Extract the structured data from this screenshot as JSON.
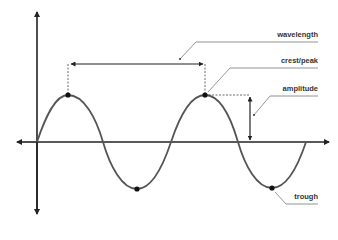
{
  "diagram": {
    "labels": {
      "wavelength": "wavelength",
      "crest": "crest/peak",
      "amplitude": "amplitude",
      "trough": "trough"
    },
    "colors": {
      "axis": "#222222",
      "wave": "#555555",
      "leader": "#666666",
      "dashed": "#444444",
      "point": "#111111",
      "text": "#333333"
    },
    "axes": {
      "origin": [
        37,
        142
      ],
      "x_range": [
        16,
        330
      ],
      "y_range": [
        10,
        214
      ]
    },
    "points": {
      "crest_1": [
        68,
        95
      ],
      "trough_1": [
        137,
        189
      ],
      "crest_2": [
        205,
        95
      ],
      "trough_2": [
        272,
        188
      ]
    }
  }
}
